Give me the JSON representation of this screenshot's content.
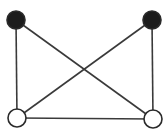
{
  "diagram": {
    "type": "graph",
    "background": "#ffffff",
    "edge_color": "#3a3a3a",
    "node_stroke": "#2a2a2a",
    "nodes": [
      {
        "id": "A",
        "x": 16,
        "y": 20,
        "r": 9,
        "fill": "#1c1c1c",
        "label": "top-left black node"
      },
      {
        "id": "B",
        "x": 152,
        "y": 20,
        "r": 9,
        "fill": "#1c1c1c",
        "label": "top-right black node"
      },
      {
        "id": "C",
        "x": 17,
        "y": 118,
        "r": 9,
        "fill": "#ffffff",
        "label": "bottom-left white node"
      },
      {
        "id": "D",
        "x": 153,
        "y": 119,
        "r": 9,
        "fill": "#ffffff",
        "label": "bottom-right white node"
      }
    ],
    "edges": [
      {
        "from": "A",
        "to": "C"
      },
      {
        "from": "A",
        "to": "D"
      },
      {
        "from": "B",
        "to": "C"
      },
      {
        "from": "B",
        "to": "D"
      },
      {
        "from": "C",
        "to": "D"
      }
    ]
  }
}
